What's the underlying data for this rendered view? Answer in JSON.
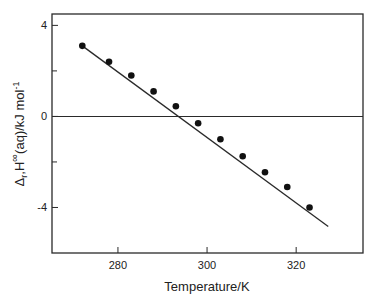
{
  "chart_data": {
    "type": "scatter",
    "title": "",
    "xlabel": "Temperature/K",
    "ylabel": "Δ_r H^∞(aq)/kJ mol^-1",
    "ylabel_parts": {
      "delta": "Δ",
      "sub": "r",
      "H": "H",
      "sup": "∞",
      "rest": "(aq)/kJ mol",
      "unit_sup": "-1"
    },
    "xlim": [
      265.2,
      335
    ],
    "ylim": [
      -6.0,
      4.5
    ],
    "x_ticks": [
      280,
      300,
      320
    ],
    "x_tick_labels": [
      "280",
      "300",
      "320"
    ],
    "y_ticks_major": [
      4,
      0,
      -4
    ],
    "y_tick_labels": [
      "4",
      "0",
      "-4"
    ],
    "y_ticks_minor": [
      2,
      -2
    ],
    "grid": false,
    "reference_line": {
      "y": 0,
      "label": "zero line"
    },
    "series": [
      {
        "name": "measured",
        "marker": "filled-circle",
        "x": [
          272,
          278,
          283,
          288,
          293,
          298,
          303,
          308,
          313,
          318,
          323
        ],
        "y": [
          3.1,
          2.4,
          1.8,
          1.1,
          0.45,
          -0.3,
          -1.0,
          -1.75,
          -2.45,
          -3.1,
          -4.0
        ]
      },
      {
        "name": "fit",
        "marker": "none",
        "line": "solid",
        "x": [
          272,
          327.2
        ],
        "y": [
          3.1,
          -4.84
        ]
      }
    ],
    "legend": null
  }
}
